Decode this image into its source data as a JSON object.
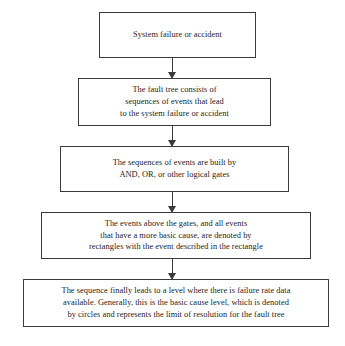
{
  "diagram": {
    "type": "flowchart",
    "orientation": "vertical-top-down",
    "node_shape": "rectangle",
    "connector": "downward-arrow",
    "colors": {
      "background": "#ffffff",
      "border": "#3a3a3a",
      "text": "#232323",
      "arrow": "#3a3a3a"
    },
    "nodes": [
      {
        "id": "node-1",
        "name": "system-failure-node",
        "lines": [
          "System failure or accident"
        ]
      },
      {
        "id": "node-2",
        "name": "fault-tree-consists-node",
        "lines": [
          "The fault tree consists of",
          "sequences of events that lead",
          "to the system failure or accident"
        ]
      },
      {
        "id": "node-3",
        "name": "logical-gates-node",
        "lines": [
          "The sequences of events are built by",
          "AND, OR, or other logical gates"
        ]
      },
      {
        "id": "node-4",
        "name": "rectangles-events-node",
        "lines": [
          "The events above the gates, and all events",
          "that have a more basic cause, are denoted by",
          "rectangles with the event described in the rectangle"
        ]
      },
      {
        "id": "node-5",
        "name": "basic-cause-circles-node",
        "lines": [
          "The sequence finally leads to a level where there is failure rate data",
          "available. Generally, this is the basic cause level, which is denoted",
          "by circles and represents the limit of resolution for the fault tree"
        ]
      }
    ],
    "edges": [
      {
        "id": "conn-1",
        "name": "arrow-node1-to-node2",
        "from": "node-1",
        "to": "node-2"
      },
      {
        "id": "conn-2",
        "name": "arrow-node2-to-node3",
        "from": "node-2",
        "to": "node-3"
      },
      {
        "id": "conn-3",
        "name": "arrow-node3-to-node4",
        "from": "node-3",
        "to": "node-4"
      },
      {
        "id": "conn-4",
        "name": "arrow-node4-to-node5",
        "from": "node-4",
        "to": "node-5"
      }
    ]
  }
}
